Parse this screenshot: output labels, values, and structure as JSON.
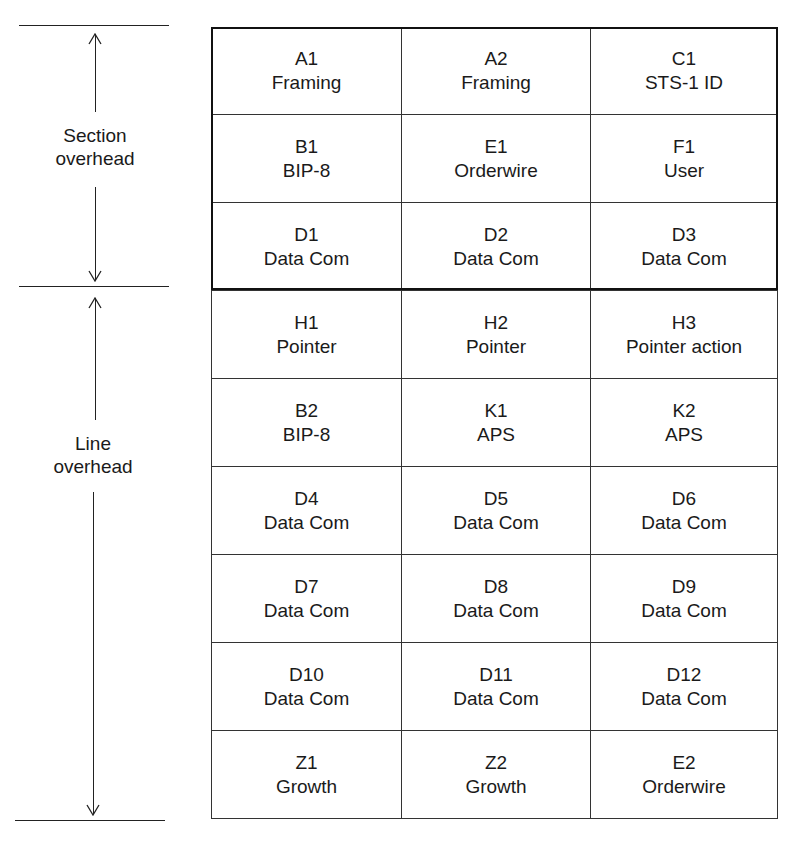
{
  "labels": {
    "section": [
      "Section",
      "overhead"
    ],
    "line": [
      "Line",
      "overhead"
    ]
  },
  "section_rows": [
    [
      {
        "code": "A1",
        "name": "Framing"
      },
      {
        "code": "A2",
        "name": "Framing"
      },
      {
        "code": "C1",
        "name": "STS-1 ID"
      }
    ],
    [
      {
        "code": "B1",
        "name": "BIP-8"
      },
      {
        "code": "E1",
        "name": "Orderwire"
      },
      {
        "code": "F1",
        "name": "User"
      }
    ],
    [
      {
        "code": "D1",
        "name": "Data Com"
      },
      {
        "code": "D2",
        "name": "Data Com"
      },
      {
        "code": "D3",
        "name": "Data Com"
      }
    ]
  ],
  "line_rows": [
    [
      {
        "code": "H1",
        "name": "Pointer"
      },
      {
        "code": "H2",
        "name": "Pointer"
      },
      {
        "code": "H3",
        "name": "Pointer action"
      }
    ],
    [
      {
        "code": "B2",
        "name": "BIP-8"
      },
      {
        "code": "K1",
        "name": "APS"
      },
      {
        "code": "K2",
        "name": "APS"
      }
    ],
    [
      {
        "code": "D4",
        "name": "Data Com"
      },
      {
        "code": "D5",
        "name": "Data Com"
      },
      {
        "code": "D6",
        "name": "Data Com"
      }
    ],
    [
      {
        "code": "D7",
        "name": "Data Com"
      },
      {
        "code": "D8",
        "name": "Data Com"
      },
      {
        "code": "D9",
        "name": "Data Com"
      }
    ],
    [
      {
        "code": "D10",
        "name": "Data Com"
      },
      {
        "code": "D11",
        "name": "Data Com"
      },
      {
        "code": "D12",
        "name": "Data Com"
      }
    ],
    [
      {
        "code": "Z1",
        "name": "Growth"
      },
      {
        "code": "Z2",
        "name": "Growth"
      },
      {
        "code": "E2",
        "name": "Orderwire"
      }
    ]
  ]
}
